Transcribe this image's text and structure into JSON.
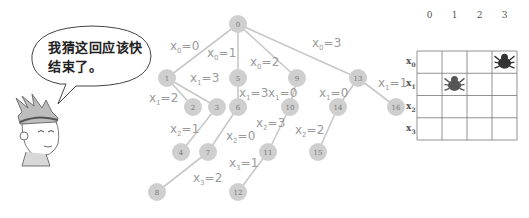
{
  "speech_bubble": {
    "line1": "我猜这回应该快",
    "line2": "结束了。"
  },
  "character": {
    "icon": "cartoon-boy-icon"
  },
  "tree": {
    "node_color": "#cfcfcf",
    "edge_color": "#c8c8c8",
    "label_color": "#9a9a9a",
    "nodes": [
      {
        "id": "0",
        "x": 238,
        "y": 24
      },
      {
        "id": "1",
        "x": 167,
        "y": 78
      },
      {
        "id": "5",
        "x": 238,
        "y": 78
      },
      {
        "id": "9",
        "x": 297,
        "y": 78
      },
      {
        "id": "13",
        "x": 358,
        "y": 78
      },
      {
        "id": "2",
        "x": 193,
        "y": 107
      },
      {
        "id": "3",
        "x": 217,
        "y": 107
      },
      {
        "id": "6",
        "x": 238,
        "y": 107
      },
      {
        "id": "10",
        "x": 290,
        "y": 107
      },
      {
        "id": "14",
        "x": 338,
        "y": 107
      },
      {
        "id": "16",
        "x": 396,
        "y": 107
      },
      {
        "id": "4",
        "x": 181,
        "y": 152
      },
      {
        "id": "7",
        "x": 208,
        "y": 152
      },
      {
        "id": "11",
        "x": 268,
        "y": 152
      },
      {
        "id": "15",
        "x": 318,
        "y": 152
      },
      {
        "id": "8",
        "x": 157,
        "y": 192
      },
      {
        "id": "12",
        "x": 238,
        "y": 192
      }
    ],
    "edges": [
      {
        "from": "0",
        "to": "1",
        "label": "x0=0",
        "var": "x",
        "sub": "0",
        "val": "0",
        "lx": 170,
        "ly": 50
      },
      {
        "from": "0",
        "to": "5",
        "label": "x0=1",
        "var": "x",
        "sub": "0",
        "val": "1",
        "lx": 207,
        "ly": 57
      },
      {
        "from": "0",
        "to": "9",
        "label": "x0=2",
        "var": "x",
        "sub": "0",
        "val": "2",
        "lx": 250,
        "ly": 66
      },
      {
        "from": "0",
        "to": "13",
        "label": "x0=3",
        "var": "x",
        "sub": "0",
        "val": "3",
        "lx": 312,
        "ly": 47
      },
      {
        "from": "1",
        "to": "2",
        "label": "x1=2",
        "var": "x",
        "sub": "1",
        "val": "2",
        "lx": 149,
        "ly": 102
      },
      {
        "from": "1",
        "to": "3",
        "label": "x1=3",
        "var": "x",
        "sub": "1",
        "val": "3",
        "lx": 190,
        "ly": 82
      },
      {
        "from": "5",
        "to": "6",
        "label": "x1=3",
        "var": "x",
        "sub": "1",
        "val": "3",
        "lx": 239,
        "ly": 97
      },
      {
        "from": "9",
        "to": "10",
        "label": "x1=0",
        "var": "x",
        "sub": "1",
        "val": "0",
        "lx": 268,
        "ly": 97
      },
      {
        "from": "13",
        "to": "14",
        "label": "x1=0",
        "var": "x",
        "sub": "1",
        "val": "0",
        "lx": 319,
        "ly": 97
      },
      {
        "from": "13",
        "to": "16",
        "label": "x1=1",
        "var": "x",
        "sub": "1",
        "val": "1",
        "lx": 378,
        "ly": 87
      },
      {
        "from": "3",
        "to": "4",
        "label": "x2=1",
        "var": "x",
        "sub": "2",
        "val": "1",
        "lx": 170,
        "ly": 133
      },
      {
        "from": "6",
        "to": "7",
        "label": "x2=0",
        "var": "x",
        "sub": "2",
        "val": "0",
        "lx": 226,
        "ly": 140
      },
      {
        "from": "10",
        "to": "11",
        "label": "x2=3",
        "var": "x",
        "sub": "2",
        "val": "3",
        "lx": 256,
        "ly": 127
      },
      {
        "from": "14",
        "to": "15",
        "label": "x2=2",
        "var": "x",
        "sub": "2",
        "val": "2",
        "lx": 295,
        "ly": 134
      },
      {
        "from": "7",
        "to": "8",
        "label": "x3=2",
        "var": "x",
        "sub": "3",
        "val": "2",
        "lx": 193,
        "ly": 182
      },
      {
        "from": "11",
        "to": "12",
        "label": "x3=1",
        "var": "x",
        "sub": "3",
        "val": "1",
        "lx": 229,
        "ly": 167
      }
    ]
  },
  "board": {
    "column_labels": [
      "0",
      "1",
      "2",
      "3"
    ],
    "row_labels": [
      {
        "var": "x",
        "sub": "0"
      },
      {
        "var": "x",
        "sub": "1"
      },
      {
        "var": "x",
        "sub": "2"
      },
      {
        "var": "x",
        "sub": "3"
      }
    ],
    "pieces": [
      {
        "row": 0,
        "col": 3,
        "icon": "spider-icon",
        "color": "#333333"
      },
      {
        "row": 1,
        "col": 1,
        "icon": "spider-icon",
        "color": "#555555"
      }
    ],
    "line_color": "#777777"
  }
}
